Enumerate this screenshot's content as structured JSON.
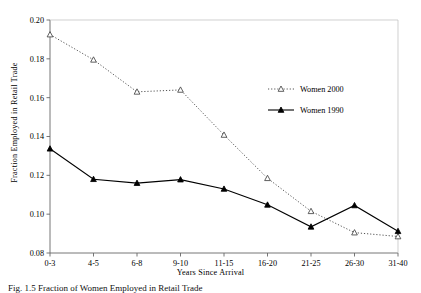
{
  "figure": {
    "caption": "Fig. 1.5  Fraction of Women Employed in Retail Trade"
  },
  "chart_data": {
    "type": "line",
    "title": "",
    "xlabel": "Years Since Arrival",
    "ylabel": "Fraction Employed in Retail Trade",
    "categories": [
      "0-3",
      "4-5",
      "6-8",
      "9-10",
      "11-15",
      "16-20",
      "21-25",
      "26-30",
      "31-40"
    ],
    "ylim": [
      0.08,
      0.2
    ],
    "yticks": [
      "0.08",
      "0.10",
      "0.12",
      "0.14",
      "0.16",
      "0.18",
      "0.20"
    ],
    "ytick_values": [
      0.08,
      0.1,
      0.12,
      0.14,
      0.16,
      0.18,
      0.2
    ],
    "grid": false,
    "legend_position": "upper right",
    "series": [
      {
        "name": "Women 2000",
        "marker": "open-triangle",
        "linestyle": "dotted",
        "color": "#555555",
        "values": [
          0.1925,
          0.1795,
          0.163,
          0.164,
          0.1408,
          0.1185,
          0.1015,
          0.0905,
          0.0885
        ]
      },
      {
        "name": "Women 1990",
        "marker": "filled-triangle",
        "linestyle": "solid",
        "color": "#000000",
        "values": [
          0.1337,
          0.118,
          0.116,
          0.1178,
          0.113,
          0.1048,
          0.0935,
          0.1045,
          0.0912
        ]
      }
    ]
  }
}
